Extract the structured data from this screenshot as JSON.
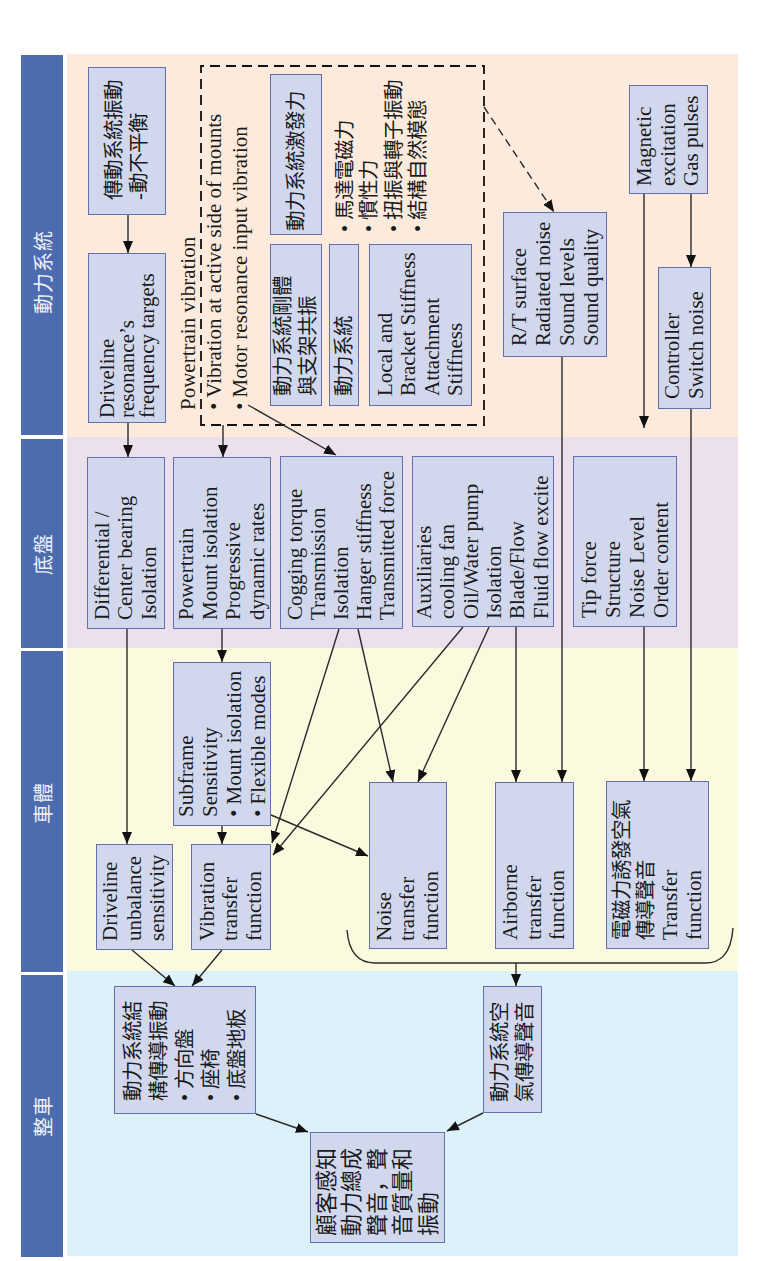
{
  "sections": {
    "powertrain": {
      "label": "動力系統",
      "color": "#fcebdc",
      "nodes": {
        "driveline_vibration": {
          "lines": [
            "傳動系統振動",
            "-動不平衡"
          ]
        },
        "driveline_resonance": {
          "lines": [
            "Driveline",
            "resonance’s",
            "frequency targets"
          ]
        },
        "excitation_force": {
          "lines": [
            "動力系統激發力"
          ]
        },
        "rigid_body_resonance": {
          "lines": [
            "動力系統剛體",
            "與支架共振"
          ]
        },
        "powertrain_system": {
          "lines": [
            "動力系統"
          ]
        },
        "bracket_stiffness": {
          "lines": [
            "Local and",
            "Bracket Stiffness",
            "Attachment",
            "Stiffness"
          ]
        },
        "radiated_noise": {
          "lines": [
            "R/T surface",
            "Radiated noise",
            "Sound levels",
            "Sound quality"
          ]
        },
        "magnetic_excitation": {
          "lines": [
            "Magnetic",
            "excitation",
            "Gas pulses"
          ]
        },
        "controller": {
          "lines": [
            "Controller",
            "Switch noise"
          ]
        }
      },
      "annotations": {
        "powertrain_vibration": {
          "title": "Powertrain vibration",
          "bullets": [
            "• Vibration at active side of mounts",
            "• Motor resonance input vibration"
          ]
        },
        "excitation_sources": {
          "bullets": [
            "• 馬達電磁力",
            "• 慣性力",
            "• 扭振與轉子振動",
            "• 結構自然模態"
          ]
        }
      }
    },
    "chassis": {
      "label": "底盤",
      "color": "#ece0ec",
      "nodes": {
        "differential": {
          "lines": [
            "Differential /",
            "Center bearing",
            "Isolation"
          ]
        },
        "powertrain_mount": {
          "lines": [
            "Powertrain",
            "Mount isolation",
            "Progressive",
            "dynamic rates"
          ]
        },
        "cogging_torque": {
          "lines": [
            "Cogging torque",
            "Transmission",
            "Isolation",
            "Hanger stiffness",
            "Transmitted force"
          ]
        },
        "auxiliaries": {
          "lines": [
            "Auxiliaries",
            "cooling fan",
            "Oil/Water pump",
            "Isolation",
            "Blade/Flow",
            "Fluid flow excite"
          ]
        },
        "tip_force": {
          "lines": [
            "Tip force",
            "Structure",
            "Noise Level",
            "Order content"
          ]
        }
      }
    },
    "body": {
      "label": "車體",
      "color": "#fbfadf",
      "nodes": {
        "subframe": {
          "lines": [
            "Subframe",
            "Sensitivity",
            "• Mount isolation",
            "• Flexible modes"
          ]
        },
        "driveline_sensitivity": {
          "lines": [
            "Driveline",
            "unbalance",
            "sensitivity"
          ]
        },
        "vibration_tf": {
          "lines": [
            "Vibration",
            "transfer",
            "function"
          ]
        },
        "noise_tf": {
          "lines": [
            "Noise",
            "transfer",
            "function"
          ]
        },
        "airborne_tf": {
          "lines": [
            "Airborne",
            "transfer",
            "function"
          ]
        },
        "em_airborne_tf": {
          "lines": [
            "電磁力誘發空氣",
            "傳導聲音",
            "Transfer",
            "function"
          ]
        }
      }
    },
    "vehicle": {
      "label": "整車",
      "color": "#dcf1fa",
      "nodes": {
        "structure_borne_vibration": {
          "lines": [
            "動力系統結",
            "構傳導振動",
            "• 方向盤",
            "• 座椅",
            "• 底盤地板"
          ]
        },
        "airborne_noise": {
          "lines": [
            "動力系統空",
            "氣傳導聲音"
          ]
        },
        "customer_perception": {
          "lines": [
            "顧客感知",
            "動力總成",
            "聲音，聲",
            "音質量和",
            "振動"
          ]
        }
      }
    }
  },
  "theme": {
    "header_color": "#4d6cb0",
    "node_fill": "#d1d8ee",
    "node_border": "#6370ae"
  },
  "connections": [
    {
      "from": "driveline_vibration",
      "to": "driveline_resonance"
    },
    {
      "from": "driveline_resonance",
      "to": "differential"
    },
    {
      "from": "powertrain_vibration",
      "to": "powertrain_mount"
    },
    {
      "from": "powertrain_vibration",
      "to": "cogging_torque"
    },
    {
      "from": "powertrain_vibration",
      "to": "radiated_noise",
      "style": "dashed"
    },
    {
      "from": "radiated_noise",
      "to": "airborne_tf"
    },
    {
      "from": "magnetic_excitation",
      "to": "tip_force"
    },
    {
      "from": "magnetic_excitation",
      "to": "controller"
    },
    {
      "from": "controller",
      "to": "em_airborne_tf"
    },
    {
      "from": "tip_force",
      "to": "em_airborne_tf"
    },
    {
      "from": "auxiliaries",
      "to": "airborne_tf"
    },
    {
      "from": "auxiliaries",
      "to": "vibration_tf"
    },
    {
      "from": "auxiliaries",
      "to": "noise_tf"
    },
    {
      "from": "cogging_torque",
      "to": "vibration_tf"
    },
    {
      "from": "cogging_torque",
      "to": "noise_tf"
    },
    {
      "from": "differential",
      "to": "driveline_sensitivity"
    },
    {
      "from": "powertrain_mount",
      "to": "subframe"
    },
    {
      "from": "subframe",
      "to": "vibration_tf"
    },
    {
      "from": "subframe",
      "to": "noise_tf"
    },
    {
      "from": "driveline_sensitivity",
      "to": "structure_borne_vibration"
    },
    {
      "from": "vibration_tf",
      "to": "structure_borne_vibration"
    },
    {
      "from": "structure_borne_vibration",
      "to": "customer_perception"
    },
    {
      "from": "airborne_noise",
      "to": "customer_perception"
    },
    {
      "from": [
        "noise_tf",
        "airborne_tf",
        "em_airborne_tf"
      ],
      "to": "airborne_noise",
      "style": "brace"
    }
  ]
}
